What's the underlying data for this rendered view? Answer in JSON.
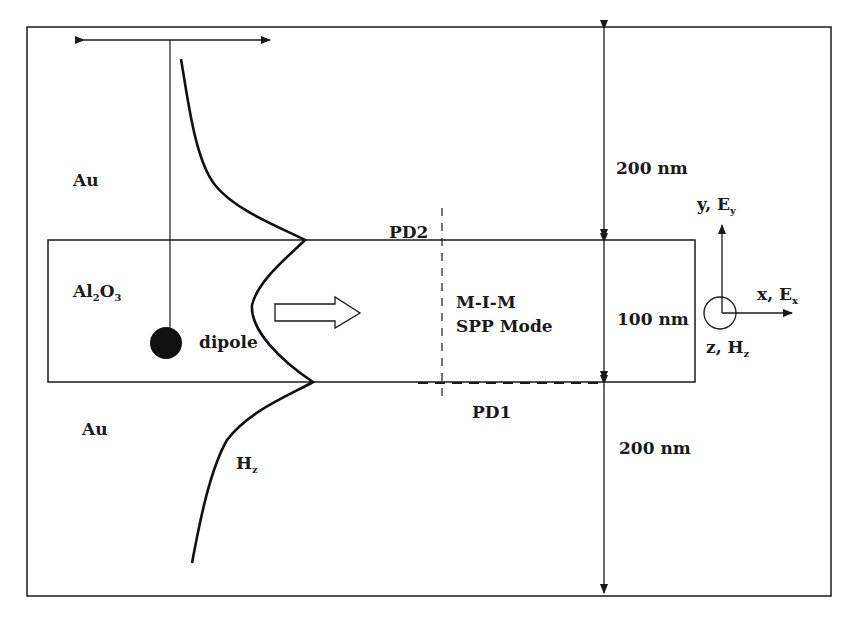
{
  "diagram": {
    "regions": {
      "top_metal": "Au",
      "insulator_main": "Al",
      "insulator_sub1": "2",
      "insulator_mid": "O",
      "insulator_sub2": "3",
      "bottom_metal": "Au"
    },
    "labels": {
      "dipole": "dipole",
      "field_main": "H",
      "field_sub": "z",
      "mode_line1": "M-I-M",
      "mode_line2": "SPP Mode",
      "pd2": "PD2",
      "pd1": "PD1"
    },
    "dimensions": {
      "top_thickness": "200 nm",
      "middle_thickness": "100 nm",
      "bottom_thickness": "200 nm"
    },
    "axes": {
      "y_main": "y, E",
      "y_sub": "y",
      "x_main": "x, E",
      "x_sub": "x",
      "z_main": "z, H",
      "z_sub": "z"
    },
    "colors": {
      "line": "#1a1a1a",
      "background": "#ffffff"
    }
  }
}
